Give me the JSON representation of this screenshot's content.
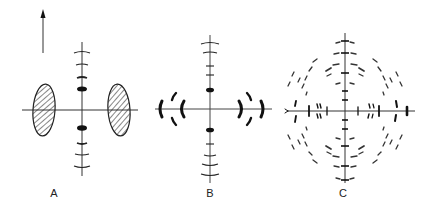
{
  "figure": {
    "panels": [
      {
        "id": "A",
        "label": "A",
        "label_pos": [
          54,
          187
        ],
        "description": "Diffraction pattern with two hatched equatorial ellipses and meridional arcs"
      },
      {
        "id": "B",
        "label": "B",
        "label_pos": [
          210,
          187
        ],
        "description": "Diffraction pattern with equatorial crescent arcs and meridional arcs"
      },
      {
        "id": "C",
        "label": "C",
        "label_pos": [
          343,
          187
        ],
        "description": "Diffraction pattern with concentric rings of dashed layer-line reflections"
      }
    ],
    "arrow": {
      "direction": "up",
      "x": 43,
      "y_top": 10,
      "y_bottom": 53
    },
    "colors": {
      "ink": "#1a1a1a",
      "axis": "#333333",
      "faint": "#555555",
      "background": "#ffffff"
    }
  }
}
